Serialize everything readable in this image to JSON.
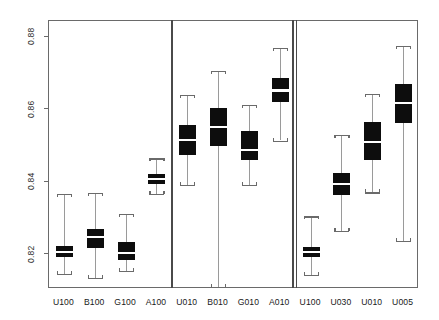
{
  "figure": {
    "title": "",
    "background": "#ffffff",
    "frame_color": "#6a6a6a",
    "box_color": "#0d0d0d",
    "median_color": "#ffffff",
    "whisker_color": "#9a9a9a"
  },
  "axis": {
    "y": {
      "ticks": [
        "0.88",
        "0.86",
        "0.84",
        "0.82"
      ],
      "tick_values": [
        0.88,
        0.86,
        0.84,
        0.82
      ],
      "min": 0.8105,
      "max": 0.8845,
      "label": ""
    },
    "x": {
      "label": "",
      "categories": [
        "U100",
        "B100",
        "G100",
        "A100",
        "U010",
        "B010",
        "G010",
        "A010",
        "U100",
        "U030",
        "U010",
        "U005"
      ]
    }
  },
  "panels": [
    {
      "name": "panel-1",
      "categories": [
        "U100",
        "B100",
        "G100",
        "A100"
      ]
    },
    {
      "name": "panel-2",
      "categories": [
        "U010",
        "B010",
        "G010",
        "A010"
      ]
    },
    {
      "name": "panel-3",
      "categories": [
        "U100",
        "U030",
        "U010",
        "U005"
      ]
    }
  ],
  "chart_data": {
    "type": "box",
    "title": "",
    "xlabel": "",
    "ylabel": "",
    "ylim": [
      0.8105,
      0.8845
    ],
    "yticks": [
      0.82,
      0.84,
      0.86,
      0.88
    ],
    "grid": false,
    "legend": "none",
    "categories": [
      "U100",
      "B100",
      "G100",
      "A100",
      "U010",
      "B010",
      "G010",
      "A010",
      "U100",
      "U030",
      "U010",
      "U005"
    ],
    "boxes": [
      {
        "label": "U100",
        "panel": 1,
        "whisker_low": 0.8146,
        "q1": 0.8192,
        "median": 0.8207,
        "q3": 0.8223,
        "whisker_high": 0.8368
      },
      {
        "label": "B100",
        "panel": 1,
        "whisker_low": 0.8135,
        "q1": 0.8218,
        "median": 0.8249,
        "q3": 0.8272,
        "whisker_high": 0.837
      },
      {
        "label": "G100",
        "panel": 1,
        "whisker_low": 0.8155,
        "q1": 0.8185,
        "median": 0.8205,
        "q3": 0.8236,
        "whisker_high": 0.8312
      },
      {
        "label": "A100",
        "panel": 1,
        "whisker_low": 0.8368,
        "q1": 0.8396,
        "median": 0.8409,
        "q3": 0.8422,
        "whisker_high": 0.8466
      },
      {
        "label": "U010",
        "panel": 2,
        "whisker_low": 0.8393,
        "q1": 0.8475,
        "median": 0.8516,
        "q3": 0.8557,
        "whisker_high": 0.8642
      },
      {
        "label": "B010",
        "panel": 2,
        "whisker_low": 0.811,
        "q1": 0.8499,
        "median": 0.8553,
        "q3": 0.8606,
        "whisker_high": 0.8707
      },
      {
        "label": "G010",
        "panel": 2,
        "whisker_low": 0.8392,
        "q1": 0.846,
        "median": 0.8489,
        "q3": 0.854,
        "whisker_high": 0.8614
      },
      {
        "label": "A010",
        "panel": 2,
        "whisker_low": 0.8515,
        "q1": 0.8621,
        "median": 0.8653,
        "q3": 0.8688,
        "whisker_high": 0.877
      },
      {
        "label": "U100",
        "panel": 3,
        "whisker_low": 0.8144,
        "q1": 0.8193,
        "median": 0.8208,
        "q3": 0.822,
        "whisker_high": 0.8306
      },
      {
        "label": "U030",
        "panel": 3,
        "whisker_low": 0.8266,
        "q1": 0.8365,
        "median": 0.8395,
        "q3": 0.8425,
        "whisker_high": 0.853
      },
      {
        "label": "U010",
        "panel": 3,
        "whisker_low": 0.8372,
        "q1": 0.8461,
        "median": 0.8512,
        "q3": 0.8565,
        "whisker_high": 0.8643
      },
      {
        "label": "U005",
        "panel": 3,
        "whisker_low": 0.8237,
        "q1": 0.8562,
        "median": 0.8618,
        "q3": 0.8672,
        "whisker_high": 0.8777
      }
    ]
  }
}
